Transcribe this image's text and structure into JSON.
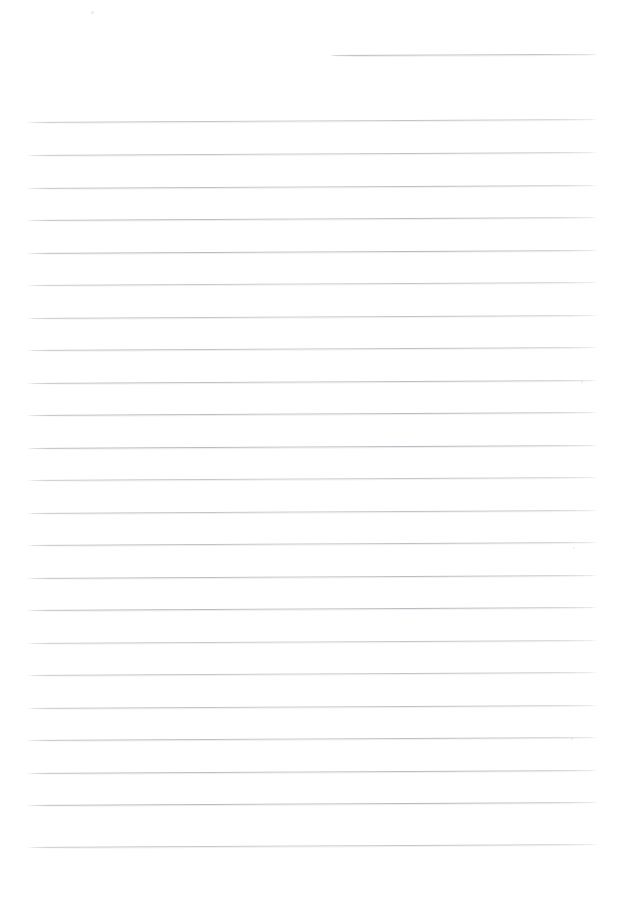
{
  "document": {
    "kind": "scanned-lined-paper",
    "title": "Blank ruled notebook page",
    "page_width": 624,
    "page_height": 898,
    "background_color": "#ffffff",
    "rule_color": "#b6b6c0",
    "rule_color_light": "#e0e0e6",
    "content_text": "",
    "visible_text": ""
  },
  "header_rule": {
    "label": "header-rule",
    "x_start": 330,
    "x_end": 597,
    "y": 55,
    "tilt_px": -1
  },
  "rules": {
    "label": "body-rules",
    "count": 23,
    "x_start": 27,
    "x_end": 597,
    "first_y": 122,
    "spacing": 32.4,
    "tilt_px": -3,
    "lines": [
      {
        "index": 1,
        "y": 122
      },
      {
        "index": 2,
        "y": 155
      },
      {
        "index": 3,
        "y": 188
      },
      {
        "index": 4,
        "y": 220
      },
      {
        "index": 5,
        "y": 253
      },
      {
        "index": 6,
        "y": 285
      },
      {
        "index": 7,
        "y": 318
      },
      {
        "index": 8,
        "y": 350
      },
      {
        "index": 9,
        "y": 383
      },
      {
        "index": 10,
        "y": 415
      },
      {
        "index": 11,
        "y": 448
      },
      {
        "index": 12,
        "y": 480
      },
      {
        "index": 13,
        "y": 513
      },
      {
        "index": 14,
        "y": 545
      },
      {
        "index": 15,
        "y": 578
      },
      {
        "index": 16,
        "y": 610
      },
      {
        "index": 17,
        "y": 643
      },
      {
        "index": 18,
        "y": 675
      },
      {
        "index": 19,
        "y": 708
      },
      {
        "index": 20,
        "y": 740
      },
      {
        "index": 21,
        "y": 773
      },
      {
        "index": 22,
        "y": 805
      },
      {
        "index": 23,
        "y": 847
      }
    ]
  },
  "artifacts": {
    "label": "scan-specks",
    "items": [
      {
        "name": "speck-top-left",
        "x": 92,
        "y": 12,
        "size": 3.0,
        "opacity": 0.22
      },
      {
        "name": "speck-right-upper",
        "x": 582,
        "y": 382,
        "size": 2.2,
        "opacity": 0.2
      },
      {
        "name": "speck-right-mid",
        "x": 574,
        "y": 548,
        "size": 2.4,
        "opacity": 0.18
      },
      {
        "name": "speck-right-lower",
        "x": 572,
        "y": 739,
        "size": 2.6,
        "opacity": 0.2
      }
    ]
  },
  "margins": {
    "top_blank_px": 55,
    "bottom_blank_px": 51,
    "left_blank_px": 27,
    "right_blank_px": 27
  }
}
